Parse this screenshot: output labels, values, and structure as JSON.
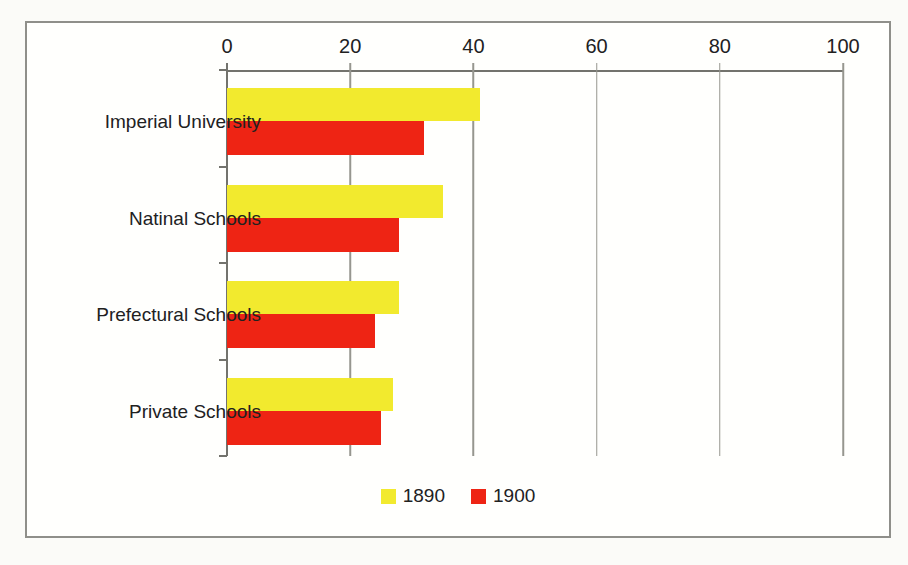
{
  "chart_data": {
    "type": "bar",
    "orientation": "horizontal",
    "title": "",
    "categories": [
      "Imperial University",
      "Natinal Schools",
      "Prefectural Schools",
      "Private Schools"
    ],
    "series": [
      {
        "name": "1890",
        "color": "#f2ea2e",
        "values": [
          41,
          35,
          28,
          27
        ]
      },
      {
        "name": "1900",
        "color": "#ee2414",
        "values": [
          32,
          28,
          24,
          25
        ]
      }
    ],
    "value_axis": {
      "min": 0,
      "max": 100,
      "ticks": [
        0,
        20,
        40,
        60,
        80,
        100
      ],
      "position": "top"
    },
    "grid": true,
    "legend_position": "bottom"
  },
  "style": {
    "grid_color": "#96968f",
    "axis_color": "#73736d",
    "text_color": "#21211f",
    "frame_border_color": "#8f8f8a",
    "plot_background": "#fffffd"
  }
}
